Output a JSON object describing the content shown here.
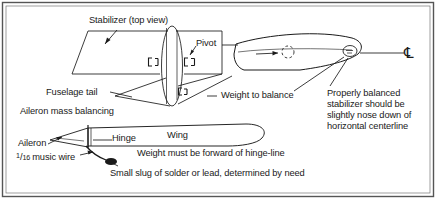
{
  "figure": {
    "title_alt": "Stabilizer and aileron mass balancing diagram",
    "border_color": "#4a4a4a",
    "ink_color": "#1a1a1a"
  },
  "labels": {
    "stabilizer_top_view": "Stabilizer (top view)",
    "pivot": "Pivot",
    "fuselage_tail": "Fuselage tail",
    "weight_to_balance": "Weight to balance",
    "aileron_mass_balancing": "Aileron mass balancing",
    "aileron": "Aileron",
    "hinge": "Hinge",
    "wing": "Wing",
    "music_wire_numerator": "1",
    "music_wire_denominator": "16",
    "music_wire_text": "music wire",
    "weight_forward": "Weight must be forward of hinge-line",
    "small_slug": "Small slug of solder or lead, determined by need",
    "properly_balanced": "Properly balanced stabilizer should be slightly nose down of horizontal centerline",
    "centerline_symbol": "℄"
  },
  "callouts": [
    {
      "name": "stabilizer-top-view",
      "target": "stabilizer planform leading edge"
    },
    {
      "name": "pivot",
      "target": "pivot bracket on pod"
    },
    {
      "name": "fuselage-tail",
      "target": "tail boom junction"
    },
    {
      "name": "weight-to-balance",
      "target": "airfoil nose weight"
    },
    {
      "name": "properly-balanced",
      "target": "airfoil nose"
    },
    {
      "name": "aileron",
      "target": "aileron planform"
    },
    {
      "name": "music-wire",
      "target": "wire bend"
    },
    {
      "name": "small-slug",
      "target": "solder blob"
    },
    {
      "name": "hinge",
      "target": "hinge line"
    }
  ]
}
